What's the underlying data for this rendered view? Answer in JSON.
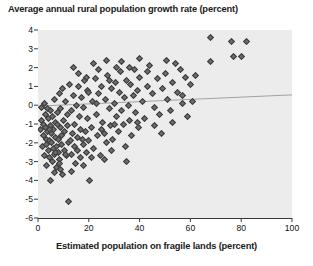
{
  "chart_data": {
    "type": "scatter",
    "title": "Average annual rural population growth rate (percent)",
    "xlabel": "Estimated population on fragile lands (percent)",
    "ylabel": "",
    "xlim": [
      0,
      100
    ],
    "ylim": [
      -6,
      4
    ],
    "xticks": [
      0,
      20,
      40,
      60,
      80,
      100
    ],
    "yticks": [
      -6,
      -5,
      -4,
      -3,
      -2,
      -1,
      0,
      1,
      2,
      3,
      4
    ],
    "grid": false,
    "legend": null,
    "plot_background": "#ececec",
    "marker": {
      "shape": "diamond",
      "fill": "#6e6e6e",
      "edge": "#3c3c3c",
      "size": 5
    },
    "trendline": {
      "kind": "linear-fit",
      "color": "#999999",
      "x_start": 0,
      "y_start": -0.05,
      "x_end": 100,
      "y_end": 0.55
    },
    "points": [
      [
        1.2,
        -0.1
      ],
      [
        1.5,
        -0.8
      ],
      [
        2.0,
        -1.0
      ],
      [
        2.2,
        -1.6
      ],
      [
        2.4,
        0.1
      ],
      [
        2.8,
        -0.5
      ],
      [
        3.0,
        -1.2
      ],
      [
        3.2,
        -1.8
      ],
      [
        3.4,
        -2.1
      ],
      [
        3.6,
        -0.2
      ],
      [
        3.8,
        -1.4
      ],
      [
        4.0,
        -2.4
      ],
      [
        4.2,
        -0.7
      ],
      [
        4.4,
        -1.9
      ],
      [
        4.6,
        -2.8
      ],
      [
        4.8,
        -1.1
      ],
      [
        5.0,
        -0.3
      ],
      [
        5.2,
        -2.0
      ],
      [
        5.4,
        -1.5
      ],
      [
        5.6,
        -3.0
      ],
      [
        5.8,
        -0.6
      ],
      [
        6.0,
        -2.3
      ],
      [
        6.2,
        -1.3
      ],
      [
        6.4,
        0.3
      ],
      [
        6.6,
        -2.6
      ],
      [
        6.8,
        -1.7
      ],
      [
        7.0,
        -0.9
      ],
      [
        7.2,
        -2.2
      ],
      [
        7.4,
        -3.3
      ],
      [
        7.6,
        -1.0
      ],
      [
        7.8,
        -0.4
      ],
      [
        8.0,
        -2.5
      ],
      [
        8.2,
        -1.8
      ],
      [
        8.4,
        0.6
      ],
      [
        8.6,
        -2.9
      ],
      [
        8.8,
        -1.2
      ],
      [
        9.0,
        -0.2
      ],
      [
        9.2,
        -2.1
      ],
      [
        9.4,
        -1.6
      ],
      [
        9.6,
        -3.7
      ],
      [
        9.8,
        0.9
      ],
      [
        10.0,
        -0.8
      ],
      [
        10.3,
        -2.4
      ],
      [
        10.6,
        -1.4
      ],
      [
        10.9,
        0.2
      ],
      [
        11.2,
        -2.7
      ],
      [
        11.5,
        -1.1
      ],
      [
        11.8,
        -0.5
      ],
      [
        12.1,
        -2.0
      ],
      [
        12.4,
        1.1
      ],
      [
        12.7,
        -1.9
      ],
      [
        13.0,
        -0.3
      ],
      [
        13.3,
        -2.6
      ],
      [
        13.6,
        -1.5
      ],
      [
        13.9,
        0.5
      ],
      [
        14.2,
        -2.2
      ],
      [
        14.5,
        -1.0
      ],
      [
        14.8,
        -3.1
      ],
      [
        15.1,
        0.0
      ],
      [
        15.4,
        -1.7
      ],
      [
        15.7,
        -2.4
      ],
      [
        16.0,
        1.0
      ],
      [
        16.3,
        -0.6
      ],
      [
        16.6,
        -1.3
      ],
      [
        16.9,
        -2.8
      ],
      [
        17.2,
        0.4
      ],
      [
        17.5,
        -1.8
      ],
      [
        17.8,
        -2.1
      ],
      [
        18.1,
        -0.1
      ],
      [
        18.4,
        1.3
      ],
      [
        18.7,
        -1.4
      ],
      [
        19.0,
        -2.5
      ],
      [
        19.3,
        -0.7
      ],
      [
        19.6,
        0.8
      ],
      [
        19.9,
        -1.9
      ],
      [
        20.4,
        -4.0
      ],
      [
        21.0,
        -1.2
      ],
      [
        21.5,
        0.2
      ],
      [
        22.0,
        -2.3
      ],
      [
        22.5,
        1.4
      ],
      [
        23.0,
        -0.5
      ],
      [
        23.5,
        -1.6
      ],
      [
        24.0,
        0.6
      ],
      [
        24.5,
        -2.7
      ],
      [
        25.0,
        1.0
      ],
      [
        25.5,
        -0.9
      ],
      [
        26.0,
        -1.5
      ],
      [
        26.5,
        0.3
      ],
      [
        27.0,
        -2.0
      ],
      [
        27.5,
        1.6
      ],
      [
        28.0,
        -0.2
      ],
      [
        28.5,
        -1.1
      ],
      [
        29.0,
        0.9
      ],
      [
        29.5,
        -1.8
      ],
      [
        30.0,
        0.1
      ],
      [
        30.5,
        1.2
      ],
      [
        31.0,
        -0.6
      ],
      [
        31.5,
        -1.4
      ],
      [
        32.0,
        0.7
      ],
      [
        32.5,
        1.8
      ],
      [
        33.0,
        -0.3
      ],
      [
        33.5,
        -1.0
      ],
      [
        34.0,
        0.4
      ],
      [
        34.5,
        -2.2
      ],
      [
        35.0,
        1.3
      ],
      [
        35.5,
        0.0
      ],
      [
        36.0,
        -0.8
      ],
      [
        36.5,
        1.1
      ],
      [
        37.0,
        -1.6
      ],
      [
        37.5,
        0.5
      ],
      [
        38.0,
        1.9
      ],
      [
        38.5,
        -0.4
      ],
      [
        39.0,
        0.8
      ],
      [
        39.5,
        -1.2
      ],
      [
        40.0,
        1.5
      ],
      [
        41.0,
        0.2
      ],
      [
        42.0,
        -0.7
      ],
      [
        43.0,
        1.0
      ],
      [
        44.0,
        2.1
      ],
      [
        45.0,
        0.6
      ],
      [
        46.0,
        -0.1
      ],
      [
        47.0,
        1.4
      ],
      [
        48.0,
        -0.5
      ],
      [
        49.0,
        0.9
      ],
      [
        50.0,
        1.7
      ],
      [
        51.0,
        0.3
      ],
      [
        52.0,
        -0.3
      ],
      [
        53.0,
        1.2
      ],
      [
        54.0,
        2.2
      ],
      [
        55.0,
        0.7
      ],
      [
        56.0,
        1.9
      ],
      [
        57.0,
        0.1
      ],
      [
        58.0,
        1.5
      ],
      [
        59.0,
        -0.6
      ],
      [
        60.0,
        1.1
      ],
      [
        46.0,
        -1.1
      ],
      [
        48.5,
        -1.5
      ],
      [
        50.5,
        2.4
      ],
      [
        33.0,
        2.3
      ],
      [
        35.0,
        -3.0
      ],
      [
        12.0,
        -5.1
      ],
      [
        9.0,
        -3.4
      ],
      [
        7.0,
        -2.5
      ],
      [
        26.0,
        -2.9
      ],
      [
        29.0,
        -2.4
      ],
      [
        18.0,
        -3.2
      ],
      [
        21.0,
        -2.8
      ],
      [
        14.0,
        2.0
      ],
      [
        16.0,
        1.7
      ],
      [
        22.0,
        2.2
      ],
      [
        24.0,
        1.9
      ],
      [
        27.0,
        2.4
      ],
      [
        31.0,
        2.0
      ],
      [
        40.0,
        2.5
      ],
      [
        43.0,
        1.8
      ],
      [
        53.0,
        -0.9
      ],
      [
        57.0,
        0.5
      ],
      [
        61.0,
        0.2
      ],
      [
        62.0,
        1.6
      ],
      [
        68.0,
        3.6
      ],
      [
        76.0,
        3.4
      ],
      [
        82.0,
        3.4
      ],
      [
        77.0,
        2.6
      ],
      [
        80.0,
        2.6
      ],
      [
        68.0,
        2.3
      ],
      [
        5.0,
        -4.0
      ],
      [
        6.5,
        -3.6
      ],
      [
        8.5,
        -3.1
      ],
      [
        11.0,
        -2.6
      ],
      [
        13.0,
        -3.5
      ],
      [
        2.5,
        -2.7
      ],
      [
        3.5,
        -3.2
      ],
      [
        1.0,
        -1.3
      ],
      [
        1.8,
        -2.2
      ],
      [
        4.5,
        -1.3
      ],
      [
        19.0,
        1.5
      ],
      [
        20.0,
        0.7
      ],
      [
        23.0,
        0.1
      ],
      [
        25.0,
        -1.3
      ],
      [
        28.0,
        1.3
      ],
      [
        30.0,
        -1.0
      ],
      [
        36.0,
        2.0
      ],
      [
        39.0,
        -0.9
      ]
    ]
  },
  "axis": {
    "ytick_labels": [
      "4",
      "3",
      "2",
      "1",
      "0",
      "-1",
      "-2",
      "-3",
      "-4",
      "-5",
      "-6"
    ],
    "xtick_labels": [
      "0",
      "20",
      "40",
      "60",
      "80",
      "100"
    ]
  }
}
